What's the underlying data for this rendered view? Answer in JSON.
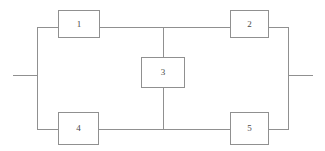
{
  "diagram": {
    "type": "block-diagram",
    "background_color": "#ffffff",
    "line_color": "#909090",
    "label_color": "#4a4a4a",
    "nodes": [
      {
        "id": "node-1",
        "label": "1",
        "position": "top-left",
        "x": 58,
        "y": 10,
        "w": 42,
        "h": 28
      },
      {
        "id": "node-2",
        "label": "2",
        "position": "top-right",
        "x": 230,
        "y": 10,
        "w": 39,
        "h": 28
      },
      {
        "id": "node-3",
        "label": "3",
        "position": "center",
        "x": 141,
        "y": 57,
        "w": 44,
        "h": 31
      },
      {
        "id": "node-4",
        "label": "4",
        "position": "bottom-left",
        "x": 58,
        "y": 112,
        "w": 41,
        "h": 33
      },
      {
        "id": "node-5",
        "label": "5",
        "position": "bottom-right",
        "x": 230,
        "y": 112,
        "w": 39,
        "h": 33
      }
    ],
    "wires": [
      {
        "id": "wire-top-left",
        "orientation": "horizontal",
        "x": 37,
        "y": 27,
        "length": 22
      },
      {
        "id": "wire-top-middle",
        "orientation": "horizontal",
        "x": 99,
        "y": 27,
        "length": 132
      },
      {
        "id": "wire-top-right",
        "orientation": "horizontal",
        "x": 268,
        "y": 27,
        "length": 21
      },
      {
        "id": "wire-bottom-left",
        "orientation": "horizontal",
        "x": 37,
        "y": 129,
        "length": 22
      },
      {
        "id": "wire-bottom-middle",
        "orientation": "horizontal",
        "x": 98,
        "y": 129,
        "length": 133
      },
      {
        "id": "wire-bottom-right",
        "orientation": "horizontal",
        "x": 268,
        "y": 129,
        "length": 21
      },
      {
        "id": "wire-rail-left",
        "orientation": "vertical",
        "x": 37,
        "y": 27,
        "length": 103
      },
      {
        "id": "wire-rail-right",
        "orientation": "vertical",
        "x": 288,
        "y": 27,
        "length": 103
      },
      {
        "id": "wire-bridge-upper",
        "orientation": "vertical",
        "x": 163,
        "y": 27,
        "length": 31
      },
      {
        "id": "wire-bridge-lower",
        "orientation": "vertical",
        "x": 163,
        "y": 88,
        "length": 42
      }
    ],
    "terminals": [
      {
        "id": "terminal-left",
        "orientation": "horizontal",
        "x": 13,
        "y": 75,
        "length": 25
      },
      {
        "id": "terminal-right",
        "orientation": "horizontal",
        "x": 288,
        "y": 75,
        "length": 25
      }
    ]
  }
}
